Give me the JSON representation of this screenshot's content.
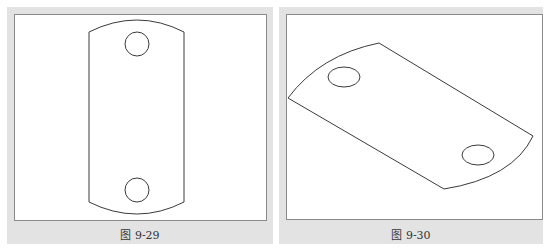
{
  "figures": [
    {
      "id": "fig-9-29",
      "caption": "图 9-29",
      "description": "Top view of plate with arc ends and two circular holes"
    },
    {
      "id": "fig-9-30",
      "caption": "图 9-30",
      "description": "Rotated isometric view of plate with two elliptical holes"
    }
  ],
  "colors": {
    "panel_bg": "#e3e3e3",
    "canvas_bg": "#ffffff",
    "stroke": "#3a3a3a"
  }
}
